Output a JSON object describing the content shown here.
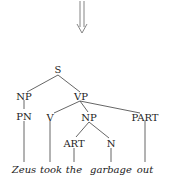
{
  "diagram": {
    "type": "parse-tree",
    "arrow": {
      "direction": "down",
      "style": "double-line"
    },
    "nodes": {
      "s": "S",
      "np_subject": "NP",
      "vp": "VP",
      "pn": "PN",
      "v": "V",
      "np_object": "NP",
      "part": "PART",
      "art": "ART",
      "n": "N"
    },
    "words": {
      "zeus": "Zeus",
      "took": "took",
      "the": "the",
      "garbage": "garbage",
      "out": "out"
    },
    "edges": [
      [
        "S",
        "NP"
      ],
      [
        "S",
        "VP"
      ],
      [
        "NP",
        "PN"
      ],
      [
        "PN",
        "Zeus"
      ],
      [
        "VP",
        "V"
      ],
      [
        "VP",
        "NP"
      ],
      [
        "VP",
        "PART"
      ],
      [
        "V",
        "took"
      ],
      [
        "NP",
        "ART"
      ],
      [
        "NP",
        "N"
      ],
      [
        "ART",
        "the"
      ],
      [
        "N",
        "garbage"
      ],
      [
        "PART",
        "out"
      ]
    ]
  }
}
